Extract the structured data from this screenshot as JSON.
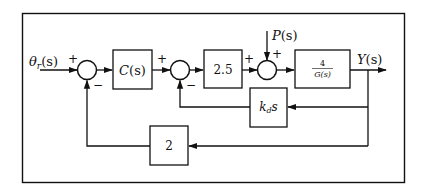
{
  "diagram": {
    "type": "control-system-block-diagram",
    "input": {
      "label": "θr(s)",
      "symbol": "θ",
      "subscript": "r",
      "arg": "(s)"
    },
    "output": {
      "label": "Y(s)",
      "symbol": "Y",
      "arg": "(s)"
    },
    "disturbance": {
      "label": "P(s)",
      "symbol": "P",
      "arg": "(s)"
    },
    "blocks": [
      {
        "id": "controller",
        "label": "C(s)",
        "symbol": "C",
        "arg": "(s)"
      },
      {
        "id": "gain",
        "label": "2.5"
      },
      {
        "id": "plant",
        "label": "4/G(s)",
        "numerator": "4",
        "denominator": "G(s)"
      },
      {
        "id": "derivative",
        "label": "k_d s",
        "symbol": "k",
        "subscript": "d",
        "suffix": "s"
      },
      {
        "id": "outer-feedback",
        "label": "2"
      }
    ],
    "summing_junctions": [
      {
        "id": "sum1",
        "signs": {
          "left": "+",
          "bottom": "−"
        }
      },
      {
        "id": "sum2",
        "signs": {
          "left": "+",
          "bottom": "−"
        }
      },
      {
        "id": "sum3",
        "signs": {
          "left": "+",
          "top": "+"
        }
      }
    ],
    "connections": [
      "θr(s) → sum1(+)",
      "sum1 → C(s)",
      "C(s) → sum2(+)",
      "sum2 → 2.5",
      "2.5 → sum3(+)",
      "P(s) → sum3(+)",
      "sum3 → 4/G(s)",
      "4/G(s) → Y(s)",
      "Y(s) → k_d s → sum2(−)",
      "Y(s) → 2 → sum1(−)"
    ]
  }
}
